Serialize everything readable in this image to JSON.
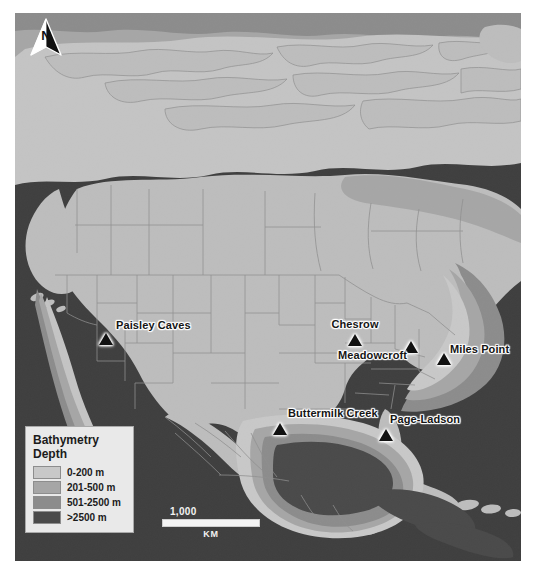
{
  "map": {
    "title": "Bathymetric map of North America with Pre-Clovis archaeological sites",
    "projection_note": "North America, Gulf of Mexico and Caribbean",
    "background_color": "#3f3f3f",
    "land_color": "#bdbdbd",
    "border_line_color": "#8a8a8a"
  },
  "north_arrow": {
    "label": "N",
    "icon": "north-arrow-icon"
  },
  "legend": {
    "title_line_1": "Bathymetry",
    "title_line_2": "Depth",
    "entries": [
      {
        "label": "0-200 m",
        "color": "#c8c8c8"
      },
      {
        "label": "201-500 m",
        "color": "#a6a6a6"
      },
      {
        "label": "501-2500 m",
        "color": "#8c8c8c"
      },
      {
        "label": ">2500 m",
        "color": "#4a4a4a"
      }
    ]
  },
  "scale_bar": {
    "value": "1,000",
    "unit": "KM"
  },
  "sites": [
    {
      "name": "Paisley Caves",
      "label_position": "right",
      "x": 91,
      "y": 320
    },
    {
      "name": "Chesrow",
      "label_position": "above",
      "x": 340,
      "y": 321
    },
    {
      "name": "Meadowcroft",
      "label_position": "left",
      "x": 396,
      "y": 328
    },
    {
      "name": "Miles Point",
      "label_position": "right",
      "x": 429,
      "y": 340
    },
    {
      "name": "Buttermilk Creek",
      "label_position": "above",
      "x": 265,
      "y": 410
    },
    {
      "name": "Page-Ladson",
      "label_position": "above",
      "x": 371,
      "y": 416
    }
  ]
}
